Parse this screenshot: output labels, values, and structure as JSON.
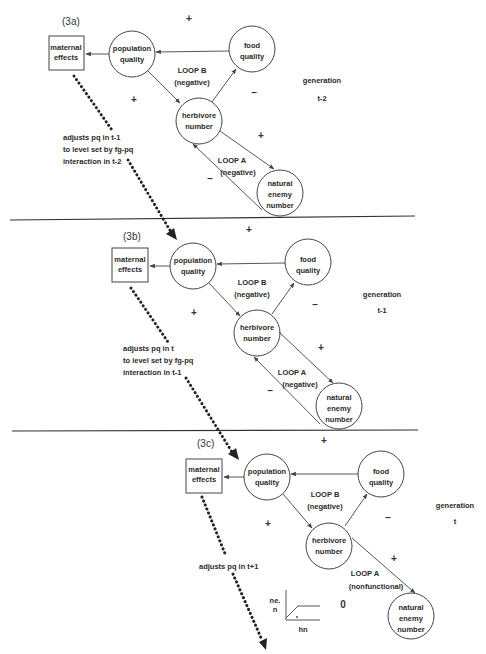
{
  "figure": {
    "panels": [
      {
        "id": "3a",
        "label": "(3a)",
        "maternal_effects": [
          "maternal",
          "effects"
        ],
        "population_quality": [
          "population",
          "quality"
        ],
        "food_quality": [
          "food",
          "quality"
        ],
        "herbivore_number": [
          "herbivore",
          "number"
        ],
        "natural_enemy_number": [
          "natural",
          "enemy",
          "number"
        ],
        "loop_b": [
          "LOOP B",
          "(negative)"
        ],
        "loop_a": [
          "LOOP A",
          "(negative)"
        ],
        "signs": {
          "top": "+",
          "left": "+",
          "right": "–",
          "loop_a_right": "+",
          "loop_a_left": "–"
        },
        "annotation": [
          "adjusts pq in t-1",
          "to level set by fg-pq",
          "interaction in t-2"
        ],
        "generation": [
          "generation",
          "t-2"
        ]
      },
      {
        "id": "3b",
        "label": "(3b)",
        "maternal_effects": [
          "maternal",
          "effects"
        ],
        "population_quality": [
          "population",
          "quality"
        ],
        "food_quality": [
          "food",
          "quality"
        ],
        "herbivore_number": [
          "herbivore",
          "number"
        ],
        "natural_enemy_number": [
          "natural",
          "enemy",
          "number"
        ],
        "loop_b": [
          "LOOP B",
          "(negative)"
        ],
        "loop_a": [
          "LOOP A",
          "(negative)"
        ],
        "signs": {
          "top": "+",
          "left": "+",
          "right": "–",
          "loop_a_right": "+",
          "loop_a_left": "–"
        },
        "annotation": [
          "adjusts pq in t",
          "to level set by fg-pq",
          "interaction in t-1"
        ],
        "generation": [
          "generation",
          "t-1"
        ]
      },
      {
        "id": "3c",
        "label": "(3c)",
        "maternal_effects": [
          "maternal",
          "effects"
        ],
        "population_quality": [
          "population",
          "quality"
        ],
        "food_quality": [
          "food",
          "quality"
        ],
        "herbivore_number": [
          "herbivore",
          "number"
        ],
        "natural_enemy_number": [
          "natural",
          "enemy",
          "number"
        ],
        "loop_b": [
          "LOOP B",
          "(negative)"
        ],
        "loop_a": [
          "LOOP A",
          "(nonfunctional)"
        ],
        "signs": {
          "top": "+",
          "left": "+",
          "right": "–",
          "loop_a_right": "+",
          "zero": "0"
        },
        "annotation": [
          "adjusts pq in t+1"
        ],
        "generation": [
          "generation",
          "t"
        ],
        "inset_graph": {
          "ylabel": [
            "ne.",
            "n"
          ],
          "xlabel": "hn"
        }
      }
    ]
  }
}
